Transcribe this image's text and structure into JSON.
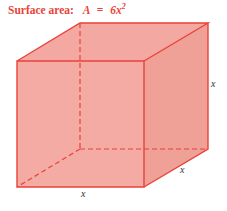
{
  "title": {
    "label": "Surface area:",
    "formula_lhs": "A",
    "formula_eq": "=",
    "formula_rhs": "6x",
    "formula_exp": "2"
  },
  "colors": {
    "title": "#e8433a",
    "edge": "#e8433a",
    "fill": "#f2a49c",
    "fill_side": "#efa097"
  },
  "cube": {
    "front": {
      "tl": [
        17,
        61
      ],
      "tr": [
        144,
        61
      ],
      "br": [
        144,
        187
      ],
      "bl": [
        17,
        187
      ]
    },
    "back": {
      "tl": [
        80,
        23
      ],
      "tr": [
        208,
        23
      ],
      "br": [
        208,
        149
      ],
      "bl": [
        80,
        149
      ]
    }
  },
  "labels": {
    "height": "x",
    "depth": "x",
    "width": "x"
  }
}
